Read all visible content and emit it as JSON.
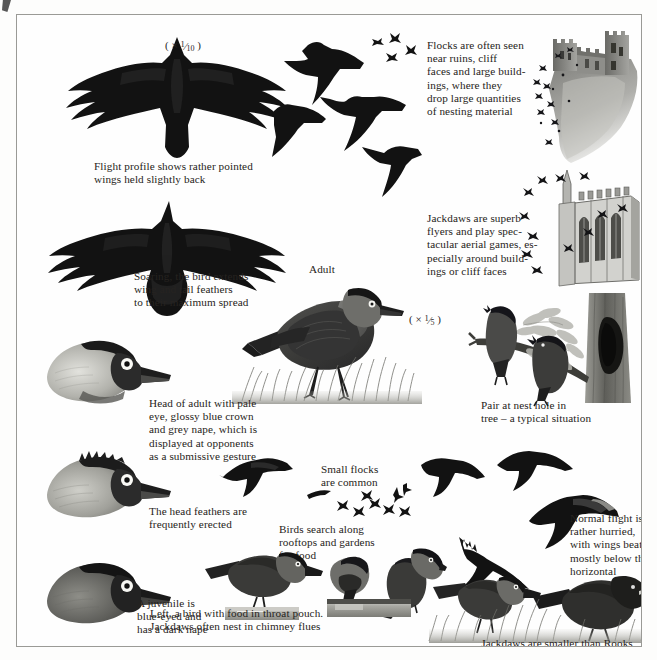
{
  "plate": {
    "title": "Jackdaw illustrated plate",
    "background": "#fefefe",
    "border_color": "#9a9a96",
    "text_color": "#262320"
  },
  "scales": [
    {
      "id": "scale-flight",
      "symbol": "×",
      "numerator": "1",
      "denominator": "10",
      "text": "( × 1/10 )"
    },
    {
      "id": "scale-adult",
      "symbol": "×",
      "numerator": "1",
      "denominator": "5",
      "text": "( × 1/5 )"
    }
  ],
  "labels": {
    "adult": "Adult"
  },
  "captions": [
    {
      "id": "flight-profile",
      "text": "Flight profile shows rather pointed\nwings held slightly back"
    },
    {
      "id": "soaring",
      "text": "Soaring, the bird extends\nwing and tail feathers\nto their maximum spread"
    },
    {
      "id": "flocks-ruins",
      "text": "Flocks are often seen\nnear ruins, cliff\nfaces and large build-\nings, where they\ndrop large quantities\nof nesting material"
    },
    {
      "id": "superb-flyers",
      "text": "Jackdaws are superb\nflyers and play spec-\ntacular aerial games, es-\npecially around build-\nings or cliff faces"
    },
    {
      "id": "head-of-adult",
      "text": "Head of adult with pale\neye, glossy blue crown\nand grey nape, which is\ndisplayed at opponents\nas a submissive gesture"
    },
    {
      "id": "head-feathers",
      "text": "The head feathers are\nfrequently erected"
    },
    {
      "id": "pair-at-nest",
      "text": "Pair at nest hole in\ntree – a typical situation"
    },
    {
      "id": "small-flocks",
      "text": "Small flocks\nare common"
    },
    {
      "id": "normal-flight",
      "text": "Normal flight is\nrather hurried,\nwith wings beating\nmostly below the\nhorizontal"
    },
    {
      "id": "birds-search",
      "text": "Birds search along\nrooftops and gardens\nfor food"
    },
    {
      "id": "juvenile",
      "text": "A juvenile is\nblue-eyed and\nhas a dark nape"
    },
    {
      "id": "throat-pouch",
      "text": "Left, a bird with food in throat pouch.\nJackdaws often nest in chimney flues"
    },
    {
      "id": "smaller-than-rooks",
      "text": "Jackdaws are smaller than Rooks"
    }
  ],
  "illustrations": [
    {
      "id": "flight-profile-bird",
      "name": "jackdaw-flight-profile-from-below"
    },
    {
      "id": "soaring-bird",
      "name": "jackdaw-soaring-from-below"
    },
    {
      "id": "flying-flock-top",
      "name": "jackdaws-in-flight-group"
    },
    {
      "id": "castle-ruins",
      "name": "castle-ruins-with-jackdaw-flock"
    },
    {
      "id": "cathedral",
      "name": "cathedral-building-with-jackdaws"
    },
    {
      "id": "adult-standing",
      "name": "adult-jackdaw-standing-in-grass"
    },
    {
      "id": "head-adult-1",
      "name": "adult-jackdaw-head-pale-eye"
    },
    {
      "id": "head-adult-2",
      "name": "adult-jackdaw-head-feathers-erected"
    },
    {
      "id": "head-juvenile",
      "name": "juvenile-jackdaw-head-dark-nape"
    },
    {
      "id": "nest-pair",
      "name": "pair-of-jackdaws-at-nest-hole-in-tree"
    },
    {
      "id": "rooftop-bird",
      "name": "jackdaw-on-rooftop"
    },
    {
      "id": "throat-pouch-bird",
      "name": "jackdaw-with-food-in-throat-pouch"
    },
    {
      "id": "chimney-bird",
      "name": "jackdaw-on-chimney"
    },
    {
      "id": "ground-jackdaw",
      "name": "jackdaw-on-ground"
    },
    {
      "id": "ground-rook",
      "name": "rook-on-ground"
    },
    {
      "id": "flight-small-1",
      "name": "jackdaw-in-flight-small"
    },
    {
      "id": "flight-small-2",
      "name": "jackdaw-in-flight-small"
    },
    {
      "id": "flight-small-3",
      "name": "jackdaw-in-flight-small"
    },
    {
      "id": "distant-flock",
      "name": "distant-flock-silhouettes"
    }
  ]
}
